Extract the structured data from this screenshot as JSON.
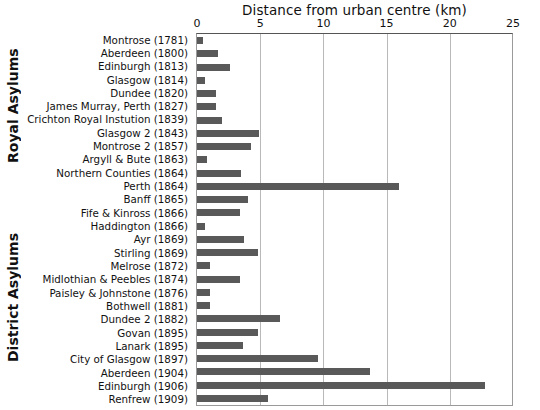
{
  "chart_data": {
    "type": "bar",
    "orientation": "horizontal",
    "title": "Distance from urban centre (km)",
    "xlabel": "Distance from urban centre (km)",
    "ylabel": "",
    "xlim": [
      0,
      25
    ],
    "xticks": [
      0,
      5,
      10,
      15,
      20,
      25
    ],
    "grid": "vertical",
    "legend": "none",
    "bar_color": "#595959",
    "groups": [
      {
        "name": "Royal Asylums",
        "categories": [
          "Montrose (1781)",
          "Aberdeen (1800)",
          "Edinburgh (1813)",
          "Glasgow (1814)",
          "Dundee (1820)",
          "James Murray, Perth (1827)",
          "Crichton Royal Instution (1839)",
          "Glasgow 2 (1843)",
          "Montrose 2 (1857)",
          "Argyll & Bute (1863)",
          "Northern Counties (1864)",
          "Perth (1864)"
        ],
        "values": [
          0.5,
          1.7,
          2.6,
          0.6,
          1.5,
          1.5,
          2.0,
          4.9,
          4.3,
          0.8,
          3.5,
          16.0
        ]
      },
      {
        "name": "District Asylums",
        "categories": [
          "Banff (1865)",
          "Fife & Kinross (1866)",
          "Haddington (1866)",
          "Ayr (1869)",
          "Stirling (1869)",
          "Melrose (1872)",
          "Midlothian & Peebles (1874)",
          "Paisley & Johnstone (1876)",
          "Bothwell (1881)",
          "Dundee 2 (1882)",
          "Govan (1895)",
          "Lanark (1895)",
          "City of Glasgow (1897)",
          "Aberdeen (1904)",
          "Edinburgh (1906)",
          "Renfrew (1909)"
        ],
        "values": [
          4.0,
          3.4,
          0.6,
          3.7,
          4.8,
          1.0,
          3.4,
          1.0,
          1.0,
          6.6,
          4.8,
          3.6,
          9.6,
          13.7,
          22.8,
          5.6
        ]
      }
    ],
    "categories": [
      "Montrose (1781)",
      "Aberdeen (1800)",
      "Edinburgh (1813)",
      "Glasgow (1814)",
      "Dundee (1820)",
      "James Murray, Perth (1827)",
      "Crichton Royal Instution (1839)",
      "Glasgow 2 (1843)",
      "Montrose 2 (1857)",
      "Argyll & Bute (1863)",
      "Northern Counties (1864)",
      "Perth (1864)",
      "Banff (1865)",
      "Fife & Kinross (1866)",
      "Haddington (1866)",
      "Ayr (1869)",
      "Stirling (1869)",
      "Melrose (1872)",
      "Midlothian & Peebles (1874)",
      "Paisley & Johnstone (1876)",
      "Bothwell (1881)",
      "Dundee 2 (1882)",
      "Govan (1895)",
      "Lanark (1895)",
      "City of Glasgow (1897)",
      "Aberdeen (1904)",
      "Edinburgh (1906)",
      "Renfrew (1909)"
    ],
    "values": [
      0.5,
      1.7,
      2.6,
      0.6,
      1.5,
      1.5,
      2.0,
      4.9,
      4.3,
      0.8,
      3.5,
      16.0,
      4.0,
      3.4,
      0.6,
      3.7,
      4.8,
      1.0,
      3.4,
      1.0,
      1.0,
      6.6,
      4.8,
      3.6,
      9.6,
      13.7,
      22.8,
      5.6
    ]
  },
  "axis": {
    "title": "Distance from urban centre (km)",
    "ticks": [
      "0",
      "5",
      "10",
      "15",
      "20",
      "25"
    ]
  },
  "groups": {
    "royal": "Royal Asylums",
    "district": "District Asylums"
  }
}
